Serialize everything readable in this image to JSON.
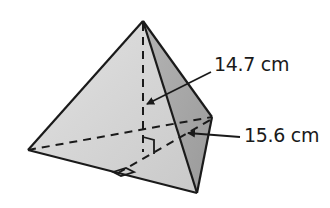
{
  "figure": {
    "type": "triangular pyramid",
    "labels": {
      "height": "14.7 cm",
      "slant_height": "15.6 cm"
    },
    "colors": {
      "front_face": "#d4d4d4",
      "right_face": "#a8a8a8",
      "edge": "#1a1a1a",
      "background": "#ffffff"
    },
    "markers": [
      "right-angle at base of height",
      "right-angle at base of slant height"
    ]
  }
}
